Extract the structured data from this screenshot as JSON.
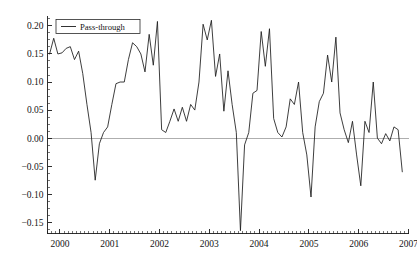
{
  "chart_data": {
    "type": "line",
    "title": "",
    "subtitle": "",
    "xlabel": "",
    "ylabel": "",
    "xlim": [
      1999.75,
      2007.0
    ],
    "ylim": [
      -0.17,
      0.215
    ],
    "grid": false,
    "zero_line": true,
    "zero_line_color": "#9a9a9a",
    "legend": {
      "position": "top-left-inside",
      "entries": [
        {
          "name": "Pass-through",
          "color": "#1b1b1b",
          "style": "solid-line"
        }
      ]
    },
    "axes": {
      "y_ticks": [
        0.2,
        0.15,
        0.1,
        0.05,
        0.0,
        -0.05,
        -0.1,
        -0.15
      ],
      "y_tick_labels": [
        "0.20",
        "0.15",
        "0.10",
        "0.05",
        "0.00",
        "−0.05",
        "−0.10",
        "−0.15"
      ],
      "y_minor_step": 0.0125,
      "x_ticks": [
        2000,
        2001,
        2002,
        2003,
        2004,
        2005,
        2006,
        2007
      ],
      "x_tick_labels": [
        "2000",
        "2001",
        "2002",
        "2003",
        "2004",
        "2005",
        "2006",
        "2007"
      ],
      "x_minor_step": 0.0833333
    },
    "series": [
      {
        "name": "Pass-through",
        "color": "#1b1b1b",
        "x": [
          1999.792,
          1999.875,
          1999.958,
          2000.042,
          2000.125,
          2000.208,
          2000.292,
          2000.375,
          2000.458,
          2000.542,
          2000.625,
          2000.708,
          2000.792,
          2000.875,
          2000.958,
          2001.042,
          2001.125,
          2001.208,
          2001.292,
          2001.375,
          2001.458,
          2001.542,
          2001.625,
          2001.708,
          2001.792,
          2001.875,
          2001.958,
          2002.042,
          2002.125,
          2002.208,
          2002.292,
          2002.375,
          2002.458,
          2002.542,
          2002.625,
          2002.708,
          2002.792,
          2002.875,
          2002.958,
          2003.042,
          2003.125,
          2003.208,
          2003.292,
          2003.375,
          2003.458,
          2003.542,
          2003.625,
          2003.708,
          2003.792,
          2003.875,
          2003.958,
          2004.042,
          2004.125,
          2004.208,
          2004.292,
          2004.375,
          2004.458,
          2004.542,
          2004.625,
          2004.708,
          2004.792,
          2004.875,
          2004.958,
          2005.042,
          2005.125,
          2005.208,
          2005.292,
          2005.375,
          2005.458,
          2005.542,
          2005.625,
          2005.708,
          2005.792,
          2005.875,
          2005.958,
          2006.042,
          2006.125,
          2006.208,
          2006.292,
          2006.375,
          2006.458,
          2006.542,
          2006.625,
          2006.708,
          2006.792,
          2006.875
        ],
        "y": [
          0.15,
          0.178,
          0.15,
          0.152,
          0.16,
          0.163,
          0.14,
          0.155,
          0.115,
          0.06,
          0.01,
          -0.075,
          -0.01,
          0.01,
          0.02,
          0.06,
          0.097,
          0.1,
          0.1,
          0.14,
          0.17,
          0.163,
          0.15,
          0.118,
          0.185,
          0.13,
          0.208,
          0.015,
          0.01,
          0.03,
          0.052,
          0.03,
          0.055,
          0.03,
          0.06,
          0.05,
          0.1,
          0.203,
          0.175,
          0.21,
          0.11,
          0.15,
          0.048,
          0.12,
          0.06,
          0.01,
          -0.165,
          -0.012,
          0.01,
          0.08,
          0.085,
          0.19,
          0.128,
          0.195,
          0.035,
          0.01,
          0.002,
          0.02,
          0.07,
          0.06,
          0.1,
          0.01,
          -0.03,
          -0.105,
          0.02,
          0.065,
          0.08,
          0.148,
          0.1,
          0.18,
          0.045,
          0.015,
          -0.008,
          0.03,
          -0.03,
          -0.085,
          0.03,
          0.01,
          0.1,
          0.0,
          -0.01,
          0.008,
          -0.005,
          0.02,
          0.015,
          -0.06
        ]
      }
    ]
  },
  "legend": {
    "label": "Pass-through"
  },
  "y_axis": {
    "labels": [
      "0.20",
      "0.15",
      "0.10",
      "0.05",
      "0.00",
      "−0.05",
      "−0.10",
      "−0.15"
    ]
  },
  "x_axis": {
    "labels": [
      "2000",
      "2001",
      "2002",
      "2003",
      "2004",
      "2005",
      "2006",
      "2007"
    ]
  }
}
